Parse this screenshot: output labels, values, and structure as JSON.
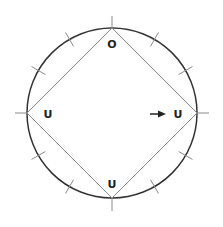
{
  "diagram": {
    "type": "circle-with-inscribed-diamond",
    "circle": {
      "cx": 112,
      "cy": 113,
      "r": 85,
      "stroke": "#333333"
    },
    "diamond_stroke": "#8a8a8a",
    "tick_stroke": "#8a8a8a",
    "tick_count": 12,
    "vertices": {
      "top": {
        "label": "O"
      },
      "left": {
        "label": "U"
      },
      "right": {
        "label": "U"
      },
      "bottom": {
        "label": "U"
      }
    },
    "arrow": {
      "direction": "right",
      "points_to": "right",
      "color": "#222222"
    }
  }
}
